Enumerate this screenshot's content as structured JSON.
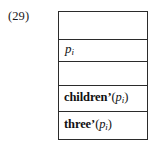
{
  "figure": {
    "equation_number": "(29)",
    "rows": [
      {
        "name": "empty-row-top",
        "content": "",
        "kind": "empty"
      },
      {
        "name": "node-label-row",
        "content": "p_i",
        "kind": "variable",
        "base": "p",
        "subscript": "i"
      },
      {
        "name": "empty-row-middle",
        "content": "",
        "kind": "empty"
      },
      {
        "name": "children-row",
        "content": "children'(p_i)",
        "kind": "function",
        "fn": "children",
        "prime": "’",
        "arg_base": "p",
        "arg_subscript": "i"
      },
      {
        "name": "three-row",
        "content": "three'(p_i)",
        "kind": "function",
        "fn": "three",
        "prime": "’",
        "arg_base": "p",
        "arg_subscript": "i"
      }
    ]
  },
  "colors": {
    "background": "#ffffff",
    "border": "#2b2b2b",
    "text": "#111111"
  }
}
